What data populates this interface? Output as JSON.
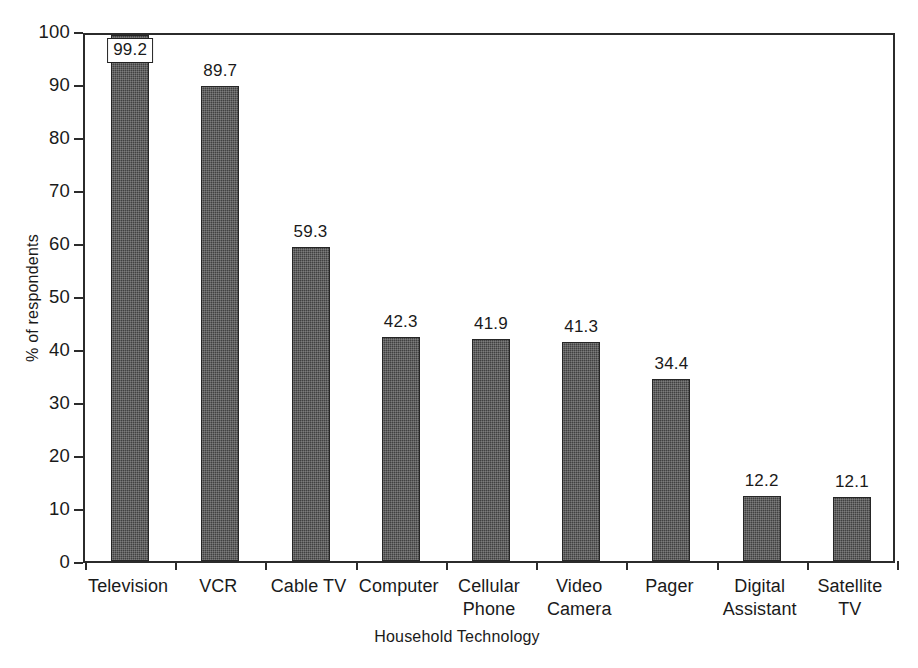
{
  "chart_data": {
    "type": "bar",
    "title": "",
    "xlabel": "Household Technology",
    "ylabel": "% of respondents",
    "ylim": [
      0,
      100
    ],
    "yticks": [
      0,
      10,
      20,
      30,
      40,
      50,
      60,
      70,
      80,
      90,
      100
    ],
    "ytick_labels": [
      "0",
      "10",
      "20",
      "30",
      "40",
      "50",
      "60",
      "70",
      "80",
      "90",
      "100"
    ],
    "grid": false,
    "legend": false,
    "bar_color": "#414141",
    "bar_edge_color": "#262626",
    "axis_color": "#2b2b2b",
    "value_labels_shown": true,
    "categories": [
      "Television",
      "VCR",
      "Cable TV",
      "Computer",
      "Cellular Phone",
      "Video Camera",
      "Pager",
      "Digital Assistant",
      "Satellite TV"
    ],
    "category_label_lines": [
      [
        "Television"
      ],
      [
        "VCR"
      ],
      [
        "Cable TV"
      ],
      [
        "Computer"
      ],
      [
        "Cellular",
        "Phone"
      ],
      [
        "Video",
        "Camera"
      ],
      [
        "Pager"
      ],
      [
        "Digital",
        "Assistant"
      ],
      [
        "Satellite TV"
      ]
    ],
    "values": [
      99.2,
      89.7,
      59.3,
      42.3,
      41.9,
      41.3,
      34.4,
      12.2,
      12.1
    ],
    "value_labels": [
      "99.2",
      "89.7",
      "59.3",
      "42.3",
      "41.9",
      "41.3",
      "34.4",
      "12.2",
      "12.1"
    ],
    "value_label_boxed": [
      true,
      false,
      false,
      false,
      false,
      false,
      false,
      false,
      false
    ]
  }
}
